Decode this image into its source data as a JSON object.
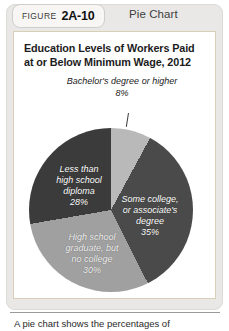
{
  "figure": {
    "word": "FIGURE",
    "number": "2A-10",
    "kind": "Pie Chart"
  },
  "panel": {
    "title_line1": "Education Levels of Workers Paid",
    "title_line2": "at or Below Minimum Wage, 2012"
  },
  "callout": {
    "line1": "Bachelor's degree",
    "line2": "or higher",
    "percent": "8%"
  },
  "footer": {
    "caption": "A pie chart shows the percentages of"
  },
  "chart_data": {
    "type": "pie",
    "title": "Education Levels of Workers Paid at or Below Minimum Wage, 2012",
    "xlabel": "",
    "ylabel": "",
    "legend_position": "none",
    "grid": false,
    "labels_inside": true,
    "categories": [
      "Bachelor's degree or higher",
      "Some college, or associate's degree",
      "High school graduate, but no college",
      "Less than high school diploma"
    ],
    "values": [
      8,
      35,
      30,
      28
    ],
    "value_labels": [
      "8%",
      "30%",
      "35%",
      "28%"
    ],
    "slices": [
      {
        "name": "Bachelor's degree or higher",
        "value": 8,
        "value_label": "8%",
        "color": "#b9b9b9",
        "label_lines": [
          "Bachelor's degree",
          "or higher",
          "8%"
        ],
        "label_placement": "callout-above"
      },
      {
        "name": "Some college, or associate's degree",
        "value": 35,
        "value_label": "35%",
        "color": "#4a4a4a",
        "label_lines": [
          "Some college,",
          "or associate's",
          "degree",
          "35%"
        ],
        "label_placement": "inside"
      },
      {
        "name": "High school graduate, but no college",
        "value": 30,
        "value_label": "30%",
        "color": "#a0a0a0",
        "label_lines": [
          "High school",
          "graduate, but",
          "no college",
          "30%"
        ],
        "label_placement": "inside"
      },
      {
        "name": "Less than high school diploma",
        "value": 28,
        "value_label": "28%",
        "color": "#3b3b3b",
        "label_lines": [
          "Less than",
          "high school",
          "diploma",
          "28%"
        ],
        "label_placement": "inside"
      }
    ]
  }
}
